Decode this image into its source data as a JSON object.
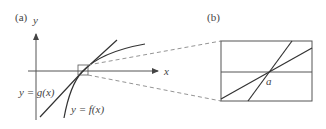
{
  "panels": {
    "a": {
      "label": "(a)",
      "y_axis_label": "y",
      "x_axis_label": "x",
      "curve_g_label": "y = g(x)",
      "curve_f_label": "y = f(x)"
    },
    "b": {
      "label": "(b)",
      "point_label": "a"
    }
  },
  "colors": {
    "line": "#333333",
    "axis": "#555555",
    "dashed": "#777777"
  }
}
